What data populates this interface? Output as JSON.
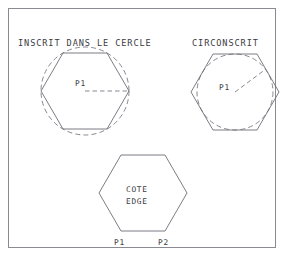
{
  "page": {
    "width": 286,
    "height": 258,
    "background": "#ffffff",
    "frame_color": "#8a8a92",
    "line_color": "#6d6d76",
    "dash_color": "#7a7a83",
    "text_color": "#3b3b42"
  },
  "figures": {
    "inscribed": {
      "title": "INSCRIT DANS LE CERCLE",
      "radius_label": "P1",
      "center": {
        "x": 85,
        "y": 91
      },
      "circumradius": 44,
      "circle_style": "dashed",
      "hexagon_style": "solid",
      "hexagon_orientation": "pointy-left-right",
      "radius_line": {
        "x1": 85,
        "y1": 91,
        "x2": 129,
        "y2": 91,
        "style": "dashed"
      }
    },
    "circumscribed": {
      "title": "CIRCONSCRIT",
      "radius_label": "P1",
      "center": {
        "x": 235,
        "y": 92
      },
      "inradius": 38,
      "circle_style": "dashed",
      "hexagon_style": "solid",
      "hexagon_orientation": "pointy-left-right",
      "radius_line": {
        "x1": 235,
        "y1": 92,
        "x2": 266,
        "y2": 69,
        "style": "dashed"
      }
    },
    "edge": {
      "label_line_1": "COTE",
      "label_line_2": "EDGE",
      "point_left_label": "P1",
      "point_right_label": "P2",
      "center": {
        "x": 143,
        "y": 193
      },
      "circumradius": 44,
      "hexagon_style": "solid",
      "hexagon_orientation": "pointy-left-right"
    }
  }
}
